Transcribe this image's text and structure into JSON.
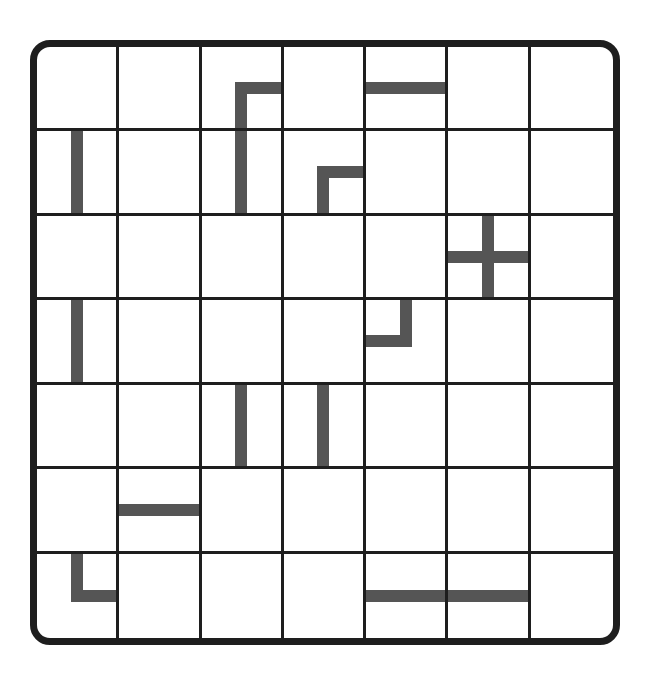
{
  "game": {
    "name": "pipe-puzzle",
    "rows": 7,
    "cols": 7,
    "colors": {
      "border": "#1e1e1e",
      "gridline": "#1e1e1e",
      "pipe": "#555555",
      "background": "#ffffff"
    },
    "pieces": [
      {
        "row": 0,
        "col": 2,
        "type": "corner",
        "connects": [
          "down",
          "right"
        ]
      },
      {
        "row": 0,
        "col": 4,
        "type": "straight",
        "connects": [
          "left",
          "right"
        ]
      },
      {
        "row": 1,
        "col": 0,
        "type": "straight",
        "connects": [
          "up",
          "down"
        ]
      },
      {
        "row": 1,
        "col": 2,
        "type": "straight",
        "connects": [
          "up",
          "down"
        ]
      },
      {
        "row": 1,
        "col": 3,
        "type": "corner",
        "connects": [
          "down",
          "right"
        ]
      },
      {
        "row": 2,
        "col": 5,
        "type": "cross",
        "connects": [
          "up",
          "down",
          "left",
          "right"
        ]
      },
      {
        "row": 3,
        "col": 0,
        "type": "straight",
        "connects": [
          "up",
          "down"
        ]
      },
      {
        "row": 3,
        "col": 4,
        "type": "corner",
        "connects": [
          "up",
          "left"
        ]
      },
      {
        "row": 4,
        "col": 2,
        "type": "straight",
        "connects": [
          "up",
          "down"
        ]
      },
      {
        "row": 4,
        "col": 3,
        "type": "straight",
        "connects": [
          "up",
          "down"
        ]
      },
      {
        "row": 5,
        "col": 1,
        "type": "straight",
        "connects": [
          "left",
          "right"
        ]
      },
      {
        "row": 6,
        "col": 0,
        "type": "corner",
        "connects": [
          "up",
          "right"
        ]
      },
      {
        "row": 6,
        "col": 4,
        "type": "straight",
        "connects": [
          "left",
          "right"
        ]
      },
      {
        "row": 6,
        "col": 5,
        "type": "straight",
        "connects": [
          "left",
          "right"
        ]
      }
    ]
  }
}
